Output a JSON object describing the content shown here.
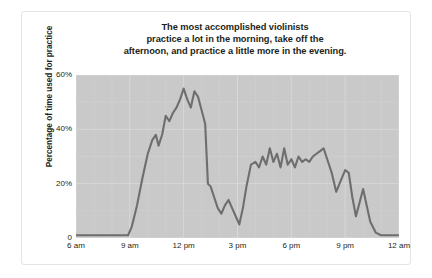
{
  "figure": {
    "title_lines": [
      "The most accomplished violinists",
      "practice a lot in the morning, take off the",
      "afternoon, and practice a little more in the evening."
    ],
    "title_text": "The most accomplished violinists practice a lot in the morning, take off the afternoon, and practice a little more in the evening.",
    "colors": {
      "plot_background": "#c9c9c9",
      "line": "#6e6e6e",
      "gridline": "#dcdcdc",
      "text": "#231f20",
      "card_border": "#e3e3e3",
      "page_background": "#ffffff"
    }
  },
  "chart_data": {
    "type": "line",
    "title": "The most accomplished violinists practice a lot in the morning, take off the afternoon, and practice a little more in the evening.",
    "xlabel": "",
    "ylabel": "Percentage of time used for practice",
    "xlim": [
      6,
      24
    ],
    "ylim": [
      0,
      60
    ],
    "grid": true,
    "legend": false,
    "xticks": [
      6,
      9,
      12,
      15,
      18,
      21,
      24
    ],
    "xticklabels": [
      "6 am",
      "9 am",
      "12 pm",
      "3 pm",
      "6 pm",
      "9 pm",
      "12 am"
    ],
    "yticks": [
      0,
      20,
      40,
      60
    ],
    "yticklabels": [
      "0",
      "20%",
      "40%",
      "60%"
    ],
    "series": [
      {
        "name": "Percentage of time used for practice",
        "x": [
          6.0,
          6.5,
          7.0,
          7.5,
          8.0,
          8.5,
          8.9,
          9.1,
          9.4,
          9.7,
          10.0,
          10.25,
          10.45,
          10.6,
          10.8,
          11.0,
          11.2,
          11.4,
          11.6,
          11.8,
          12.0,
          12.2,
          12.4,
          12.6,
          12.8,
          13.0,
          13.2,
          13.35,
          13.5,
          13.7,
          13.9,
          14.1,
          14.3,
          14.5,
          14.7,
          14.9,
          15.1,
          15.3,
          15.5,
          15.75,
          16.0,
          16.2,
          16.4,
          16.6,
          16.8,
          17.0,
          17.2,
          17.4,
          17.6,
          17.8,
          18.0,
          18.2,
          18.4,
          18.6,
          18.8,
          19.0,
          19.2,
          19.4,
          19.6,
          19.8,
          20.0,
          20.25,
          20.5,
          20.75,
          21.0,
          21.2,
          21.4,
          21.6,
          21.8,
          22.0,
          22.2,
          22.4,
          22.7,
          23.0,
          23.5,
          24.0
        ],
        "y": [
          1,
          1,
          1,
          1,
          1,
          1,
          1,
          4,
          12,
          22,
          31,
          36,
          38,
          34,
          38,
          45,
          43,
          46,
          48,
          51,
          55,
          51,
          48,
          54,
          52,
          47,
          42,
          20,
          19,
          15,
          11,
          9,
          12,
          14,
          11,
          8,
          5,
          11,
          19,
          27,
          28,
          26,
          30,
          27,
          33,
          28,
          31,
          26,
          33,
          27,
          29,
          26,
          30,
          28,
          29,
          28,
          30,
          31,
          32,
          33,
          29,
          24,
          17,
          21,
          25,
          24,
          15,
          8,
          13,
          18,
          12,
          6,
          2,
          1,
          1,
          1
        ]
      }
    ]
  }
}
